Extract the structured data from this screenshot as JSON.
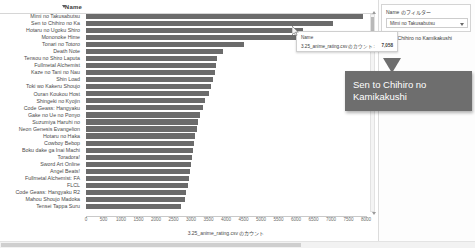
{
  "chart_data": {
    "type": "bar",
    "orientation": "horizontal",
    "title": "",
    "xlabel": "3.25_anime_rating.csv のカウント",
    "ylabel": "Name",
    "xlim": [
      0,
      8000
    ],
    "xticks": [
      0,
      500,
      1000,
      1500,
      2000,
      2500,
      3000,
      3500,
      4000,
      4500,
      5000,
      5500,
      6000,
      6500,
      7000,
      7500,
      8000
    ],
    "grid": false,
    "legend": "none",
    "bar_color": "#6b6b6b",
    "categories": [
      "Mimi no Takusabutsu",
      "Sen to Chihiro no Ka",
      "Hotaru no Ugoku Shiro",
      "Mononoke Hime",
      "Tonari no Totoro",
      "Death Note",
      "Tensou no Shiro Laputa",
      "Fullmetal Alchemist",
      "Kaze no Tani no Nau",
      "Shin Load",
      "Toki wo Kakeru Shoujo",
      "Ouran Koukou Host",
      "Shingeki no Kyojin",
      "Code Geass: Hangyaku",
      "Gake no Ue no Ponyo",
      "Suzumiya Haruhi no",
      "Neon Genesis Evangelion",
      "Hotaru no Haka",
      "Cowboy Bebop",
      "Boku dake ga Inai Machi",
      "Toradora!",
      "Sword Art Online",
      "Angel Beats!",
      "Fullmetal Alchemist: FA",
      "FLCL",
      "Code Geass: Hangyaku R2",
      "Mahou Shoujo Madoka",
      "Tensei Tappa Suru"
    ],
    "values": [
      7900,
      7058,
      6200,
      6000,
      4500,
      3900,
      3750,
      3700,
      3680,
      3640,
      3560,
      3500,
      3400,
      3330,
      3260,
      3200,
      3160,
      3120,
      3080,
      3050,
      3020,
      2990,
      2960,
      2930,
      2900,
      2870,
      2830,
      2700
    ]
  },
  "header": {
    "name_label": "Name",
    "sort_icon": "sort-descending-icon"
  },
  "tooltip": {
    "row1_label": "Name",
    "row2_label": "3.25_anime_rating.csv のカウント:",
    "row2_value": "7,058"
  },
  "filter_panel": {
    "title": "Name のフィルター",
    "selected": "Mimi no Takusabutsu",
    "caret_icon": "chevron-down-icon"
  },
  "selected_text": "Sen to Chihiro no Kamikakushi",
  "callout": {
    "text": "Sen to Chihiro no Kamikakushi",
    "background": "#6e6e6e",
    "text_color": "#ffffff"
  },
  "scrollbars": {
    "vertical_up_icon": "scroll-up-arrow-icon",
    "vertical_down_icon": "scroll-down-arrow-icon"
  }
}
